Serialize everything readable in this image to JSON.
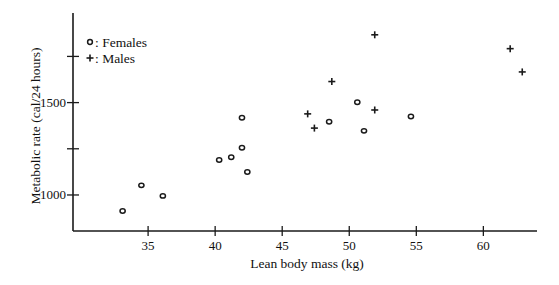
{
  "chart_data": {
    "type": "scatter",
    "title": "",
    "xlabel": "Lean body mass (kg)",
    "ylabel": "Metabolic rate (cal/24 hours)",
    "xlim": [
      29.4,
      64.0
    ],
    "ylim": [
      805,
      1985
    ],
    "xticks": [
      35,
      40,
      45,
      50,
      55,
      60
    ],
    "yticks": [
      1000,
      1250,
      1500,
      1750
    ],
    "ytick_labels": [
      "1000",
      "",
      "1500",
      ""
    ],
    "grid": false,
    "legend": {
      "position": "top-left",
      "entries": [
        {
          "marker": "o",
          "label": ": Females"
        },
        {
          "marker": "+",
          "label": ": Males"
        }
      ]
    },
    "series": [
      {
        "name": "Females",
        "marker": "o",
        "points": [
          {
            "x": 36.1,
            "y": 995
          },
          {
            "x": 54.6,
            "y": 1425
          },
          {
            "x": 48.5,
            "y": 1396
          },
          {
            "x": 42.0,
            "y": 1418
          },
          {
            "x": 50.6,
            "y": 1502
          },
          {
            "x": 42.0,
            "y": 1256
          },
          {
            "x": 40.3,
            "y": 1189
          },
          {
            "x": 33.1,
            "y": 913
          },
          {
            "x": 42.4,
            "y": 1124
          },
          {
            "x": 34.5,
            "y": 1052
          },
          {
            "x": 51.1,
            "y": 1347
          },
          {
            "x": 41.2,
            "y": 1204
          }
        ]
      },
      {
        "name": "Males",
        "marker": "+",
        "points": [
          {
            "x": 62.0,
            "y": 1792
          },
          {
            "x": 62.9,
            "y": 1666
          },
          {
            "x": 47.4,
            "y": 1362
          },
          {
            "x": 48.7,
            "y": 1614
          },
          {
            "x": 51.9,
            "y": 1460
          },
          {
            "x": 51.9,
            "y": 1867
          },
          {
            "x": 46.9,
            "y": 1439
          }
        ]
      }
    ]
  }
}
